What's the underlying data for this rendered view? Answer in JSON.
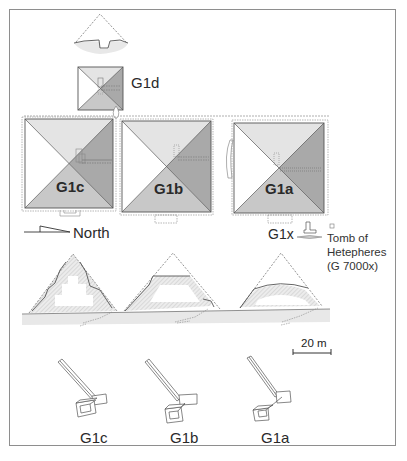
{
  "figure": {
    "colors": {
      "frame": "#8e8e8e",
      "face_light": "#e4e4e4",
      "face_mid": "#c8c8c8",
      "face_dark": "#a9a9a9",
      "face_white": "#ffffff",
      "ground": "#e6e6e6",
      "outline": "#555555"
    }
  },
  "plan": {
    "satellite": {
      "label": "G1d"
    },
    "pyramids": [
      {
        "id": "g1c",
        "label": "G1c"
      },
      {
        "id": "g1b",
        "label": "G1b"
      },
      {
        "id": "g1a",
        "label": "G1a"
      }
    ],
    "north_arrow": {
      "label": "North"
    },
    "g1x": {
      "label": "G1x"
    },
    "tomb_note": {
      "lines": [
        "Tomb of",
        "Hetepheres",
        "(G 7000x)"
      ]
    }
  },
  "section": {
    "scale_bar": {
      "label": "20 m"
    }
  },
  "axonometric": {
    "labels": [
      "G1c",
      "G1b",
      "G1a"
    ]
  }
}
